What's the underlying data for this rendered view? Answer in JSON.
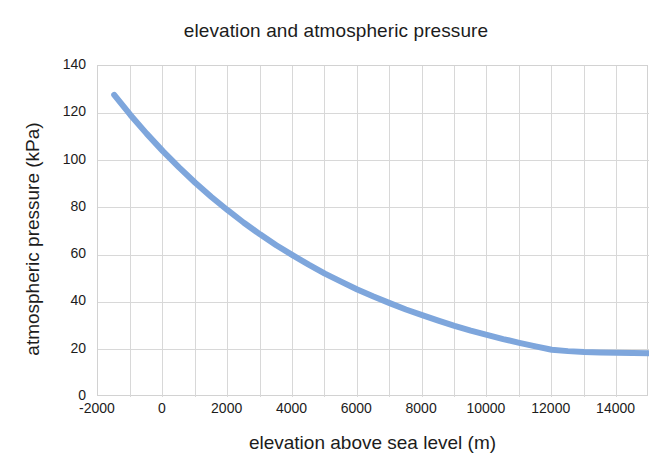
{
  "chart_data": {
    "type": "line",
    "title": "elevation and atmospheric pressure",
    "xlabel": "elevation above sea level (m)",
    "ylabel": "atmospheric pressure (kPa)",
    "xlim": [
      -2000,
      15000
    ],
    "ylim": [
      0,
      140
    ],
    "xticks": [
      -2000,
      0,
      2000,
      4000,
      6000,
      8000,
      10000,
      12000,
      14000
    ],
    "xtick_labels": [
      "-2000",
      "0",
      "2000",
      "4000",
      "6000",
      "8000",
      "10000",
      "12000",
      "14000"
    ],
    "yticks": [
      0,
      20,
      40,
      60,
      80,
      100,
      120,
      140
    ],
    "ytick_labels": [
      "0",
      "20",
      "40",
      "60",
      "80",
      "100",
      "120",
      "140"
    ],
    "x_minor_step": 1000,
    "grid": true,
    "grid_color": "#d8d8d8",
    "legend": null,
    "series": [
      {
        "name": "atmospheric pressure",
        "color": "#7ea6dc",
        "line_width": 6,
        "x": [
          -1500,
          -1000,
          -500,
          0,
          500,
          1000,
          1500,
          2000,
          2500,
          3000,
          3500,
          4000,
          4500,
          5000,
          5500,
          6000,
          6500,
          7000,
          7500,
          8000,
          8500,
          9000,
          9500,
          10000,
          10500,
          11000,
          11500,
          12000,
          12500,
          13000,
          13500,
          14000,
          14500,
          15000
        ],
        "y": [
          127.8,
          119.3,
          111.4,
          104.0,
          97.1,
          90.6,
          84.6,
          79.0,
          73.7,
          68.8,
          64.2,
          60.0,
          56.0,
          52.2,
          48.8,
          45.5,
          42.5,
          39.7,
          37.0,
          34.6,
          32.3,
          30.1,
          28.1,
          26.3,
          24.5,
          22.9,
          21.4,
          20.0,
          19.4,
          19.0,
          18.8,
          18.7,
          18.6,
          18.5
        ]
      }
    ]
  }
}
